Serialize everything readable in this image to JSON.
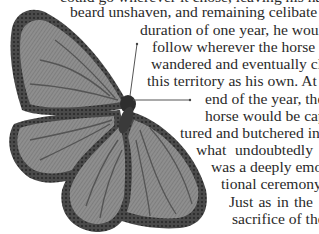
{
  "document": {
    "clipped_top_line": "could go wherever it chose, leaving his hair uncut, his",
    "lines": [
      {
        "text": "beard unshaven, and remaining celibate for the",
        "left": 70,
        "top": 3
      },
      {
        "text": "duration of one year, he would",
        "left": 140,
        "top": 21
      },
      {
        "text": "follow wherever the horse",
        "left": 152,
        "top": 38
      },
      {
        "text": "wandered and eventually claim",
        "left": 151,
        "top": 55
      },
      {
        "text": "this territory as his own. At the",
        "left": 147,
        "top": 72
      },
      {
        "text": "end of the year, the",
        "left": 205,
        "top": 90
      },
      {
        "text": "horse would be cap-",
        "left": 205,
        "top": 107
      },
      {
        "text": "tured and butchered in",
        "left": 180,
        "top": 124
      },
      {
        "text": "what undoubtedly",
        "left": 196,
        "top": 141
      },
      {
        "text": "was a deeply emo-",
        "left": 211,
        "top": 158
      },
      {
        "text": "tional ceremony.",
        "left": 221,
        "top": 175
      },
      {
        "text": "Just as in the",
        "left": 229,
        "top": 193
      },
      {
        "text": "sacrifice of the",
        "left": 232,
        "top": 210
      }
    ]
  },
  "illustration": {
    "subject": "butterfly-engraving",
    "colors": {
      "wing_fill": "#8a8a8a",
      "wing_border": "#3d3d3d",
      "vein": "#4a4a4a",
      "body": "#2e2e2e",
      "text": "#2a2a2a"
    }
  }
}
